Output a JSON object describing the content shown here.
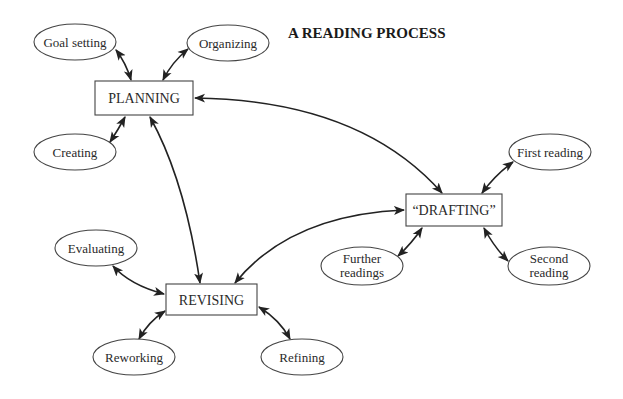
{
  "title": "A READING PROCESS",
  "colors": {
    "stroke": "#444444",
    "text": "#222222",
    "background": "#ffffff"
  },
  "nodes": {
    "planning": {
      "label": "PLANNING",
      "shape": "box"
    },
    "drafting": {
      "label": "“DRAFTING”",
      "shape": "box"
    },
    "revising": {
      "label": "REVISING",
      "shape": "box"
    },
    "goal_setting": {
      "label": "Goal setting",
      "shape": "ellipse"
    },
    "organizing": {
      "label": "Organizing",
      "shape": "ellipse"
    },
    "creating": {
      "label": "Creating",
      "shape": "ellipse"
    },
    "first_reading": {
      "label": "First reading",
      "shape": "ellipse"
    },
    "further_readings": {
      "lines": [
        "Further",
        "readings"
      ],
      "shape": "ellipse"
    },
    "second_reading": {
      "lines": [
        "Second",
        "reading"
      ],
      "shape": "ellipse"
    },
    "evaluating": {
      "label": "Evaluating",
      "shape": "ellipse"
    },
    "reworking": {
      "label": "Reworking",
      "shape": "ellipse"
    },
    "refining": {
      "label": "Refining",
      "shape": "ellipse"
    }
  },
  "edges": [
    {
      "from": "goal_setting",
      "to": "planning",
      "type": "bidirectional"
    },
    {
      "from": "organizing",
      "to": "planning",
      "type": "bidirectional"
    },
    {
      "from": "creating",
      "to": "planning",
      "type": "bidirectional"
    },
    {
      "from": "planning",
      "to": "drafting",
      "type": "bidirectional"
    },
    {
      "from": "revising",
      "to": "planning",
      "type": "bidirectional"
    },
    {
      "from": "drafting",
      "to": "revising",
      "type": "bidirectional"
    },
    {
      "from": "first_reading",
      "to": "drafting",
      "type": "bidirectional"
    },
    {
      "from": "further_readings",
      "to": "drafting",
      "type": "bidirectional"
    },
    {
      "from": "second_reading",
      "to": "drafting",
      "type": "bidirectional"
    },
    {
      "from": "evaluating",
      "to": "revising",
      "type": "bidirectional"
    },
    {
      "from": "reworking",
      "to": "revising",
      "type": "bidirectional"
    },
    {
      "from": "refining",
      "to": "revising",
      "type": "bidirectional"
    }
  ]
}
